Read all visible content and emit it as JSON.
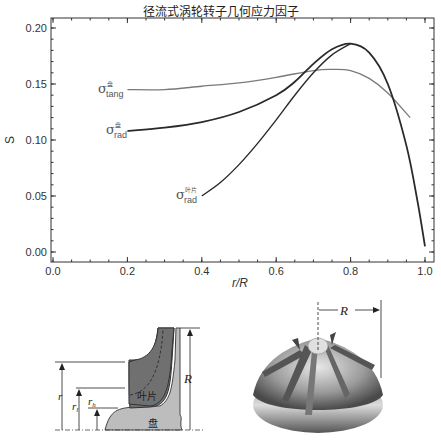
{
  "title": "径流式涡轮转子几何应力因子",
  "axes": {
    "ylabel": "S",
    "xlabel": "r/R",
    "yticks": [
      "0.00",
      "0.05",
      "0.10",
      "0.15",
      "0.20"
    ],
    "xticks": [
      "0.0",
      "0.2",
      "0.4",
      "0.6",
      "0.8",
      "1.0"
    ]
  },
  "curve_labels": {
    "tang_disc": {
      "sym": "σ",
      "sub": "tang",
      "sup": "盘"
    },
    "rad_disc": {
      "sym": "σ",
      "sub": "rad",
      "sup": "盘"
    },
    "rad_blade": {
      "sym": "σ",
      "sub": "rad",
      "sup": "叶片"
    }
  },
  "diagram": {
    "labels": {
      "r": "r",
      "rl": "r",
      "rl_sub": "l",
      "rh": "r",
      "rh_sub": "h",
      "R": "R",
      "blade": "叶片",
      "disc": "盘"
    },
    "rotor_R": "R"
  },
  "colors": {
    "dark": "#2a2a2a",
    "gray": "#7a7a7a",
    "blade_fill": "#6e6e6e",
    "disc_fill": "#bdbdbd"
  },
  "chart_data": {
    "type": "line",
    "title": "径流式涡轮转子几何应力因子",
    "xlabel": "r/R",
    "ylabel": "S",
    "xlim": [
      -0.02,
      1.02
    ],
    "ylim": [
      -0.01,
      0.21
    ],
    "grid": false,
    "series": [
      {
        "name": "σ_tang^盘",
        "color": "#7a7a7a",
        "x": [
          0.2,
          0.3,
          0.4,
          0.5,
          0.6,
          0.7,
          0.75,
          0.8,
          0.85,
          0.9,
          0.96
        ],
        "y": [
          0.145,
          0.145,
          0.148,
          0.151,
          0.156,
          0.162,
          0.163,
          0.162,
          0.155,
          0.142,
          0.12
        ]
      },
      {
        "name": "σ_rad^盘",
        "color": "#2a2a2a",
        "x": [
          0.2,
          0.3,
          0.4,
          0.5,
          0.6,
          0.65,
          0.7,
          0.75,
          0.8,
          0.85,
          0.9,
          0.95,
          0.98,
          1.0
        ],
        "y": [
          0.108,
          0.111,
          0.116,
          0.125,
          0.14,
          0.152,
          0.168,
          0.181,
          0.186,
          0.178,
          0.15,
          0.095,
          0.045,
          0.005
        ]
      },
      {
        "name": "σ_rad^叶片",
        "color": "#2a2a2a",
        "x": [
          0.4,
          0.45,
          0.5,
          0.55,
          0.6,
          0.65,
          0.7,
          0.75,
          0.8
        ],
        "y": [
          0.05,
          0.062,
          0.078,
          0.097,
          0.118,
          0.14,
          0.16,
          0.176,
          0.186
        ]
      }
    ]
  }
}
